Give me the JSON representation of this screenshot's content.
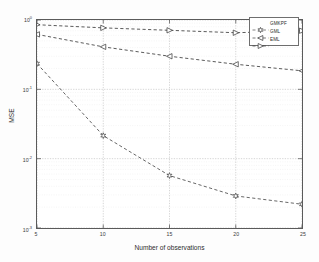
{
  "chart_data": {
    "type": "line",
    "title": "",
    "xlabel": "Number of observations",
    "ylabel": "MSE",
    "x": [
      5,
      10,
      15,
      20,
      25
    ],
    "xlim": [
      5,
      25
    ],
    "xticks": [
      5,
      10,
      15,
      20,
      25
    ],
    "xtick_labels": [
      "5",
      "10",
      "15",
      "20",
      "25"
    ],
    "yscale": "log",
    "ylim": [
      0.001,
      1
    ],
    "yticks": [
      1,
      0.1,
      0.01,
      0.001
    ],
    "ytick_labels": [
      "10",
      "10",
      "10",
      "10"
    ],
    "ytick_exponents": [
      "0",
      "-1",
      "-2",
      "-3"
    ],
    "grid": true,
    "legend_position": "upper right",
    "series": [
      {
        "name": "GMKPF",
        "marker": "hexagram",
        "linestyle": "dashed",
        "color": "#4a4a4a",
        "values": [
          0.235,
          0.0215,
          0.0057,
          0.0029,
          0.0022
        ]
      },
      {
        "name": "GML",
        "marker": "left-triangle",
        "linestyle": "dashed",
        "color": "#3c3c3c",
        "values": [
          0.62,
          0.41,
          0.3,
          0.23,
          0.185
        ]
      },
      {
        "name": "EML",
        "marker": "right-triangle",
        "linestyle": "dashed",
        "color": "#3c3c3c",
        "values": [
          0.855,
          0.77,
          0.71,
          0.655,
          0.7
        ]
      }
    ]
  },
  "legend": {
    "entries": [
      {
        "label": "GMKPF",
        "marker": "hexagram-icon"
      },
      {
        "label": "GML",
        "marker": "left-triangle-icon"
      },
      {
        "label": "EML",
        "marker": "right-triangle-icon"
      }
    ]
  }
}
